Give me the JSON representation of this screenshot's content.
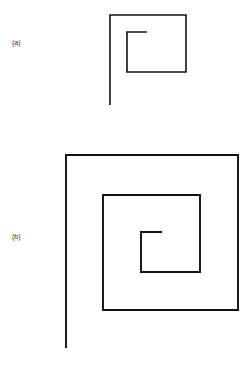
{
  "figure": {
    "background_color": "#ffffff",
    "stroke_color": "#111111",
    "width": 249,
    "height": 366
  },
  "panels": [
    {
      "id": "a",
      "label": "(a)",
      "label_x": 12,
      "label_y": 39,
      "description": "square spiral with one and a half turns",
      "turns": 1.5,
      "stroke_width": 1.6,
      "stroke_color": "#111111",
      "points": "147,32 127,32 127,72 186,72 186,15 110,15 110,105",
      "bounds": {
        "x": 110,
        "y": 15,
        "width": 76,
        "height": 90
      }
    },
    {
      "id": "b",
      "label": "(b)",
      "label_x": 12,
      "label_y": 233,
      "description": "square spiral with two and a half turns",
      "turns": 2.5,
      "stroke_width": 1.9,
      "stroke_color": "#111111",
      "points": "162,232 141,232 141,272 200,272 200,195 103,195 103,310 238,310 238,155 66,155 66,348",
      "bounds": {
        "x": 66,
        "y": 155,
        "width": 172,
        "height": 193
      }
    }
  ]
}
